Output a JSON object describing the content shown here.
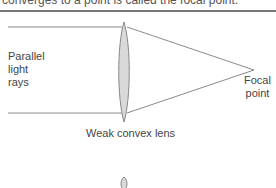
{
  "caption": "converges to a point is called the focal point.",
  "labels": {
    "parallel_rays": [
      "Parallel",
      "light",
      "rays"
    ],
    "focal_point": [
      "Focal",
      "point"
    ],
    "lens": "Weak convex lens"
  },
  "colors": {
    "ray": "#8a8a8a",
    "lens_fill": "#d9d9d9",
    "lens_stroke": "#888888",
    "rule": "#777777"
  }
}
